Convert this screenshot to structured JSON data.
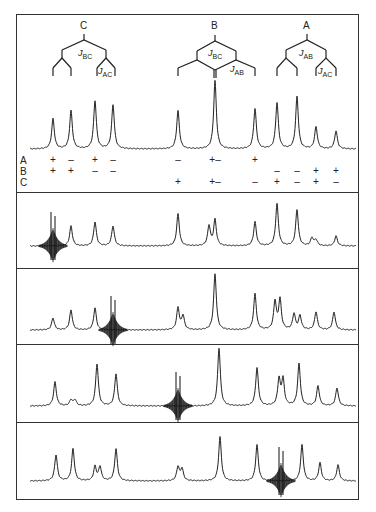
{
  "figure": {
    "trees": [
      {
        "nucleus": "C",
        "x": 84,
        "couplings": [
          {
            "name": "J",
            "sub": "BC"
          },
          {
            "name": "J",
            "sub": "AC"
          }
        ]
      },
      {
        "nucleus": "B",
        "x": 215,
        "couplings": [
          {
            "name": "J",
            "sub": "BC"
          },
          {
            "name": "J",
            "sub": "AB"
          }
        ]
      },
      {
        "nucleus": "A",
        "x": 307,
        "couplings": [
          {
            "name": "J",
            "sub": "AB"
          },
          {
            "name": "J",
            "sub": "AC"
          }
        ]
      }
    ],
    "labels": {
      "tree_C": "C",
      "tree_B": "B",
      "tree_A": "A",
      "j_C_1": "J",
      "j_C_1_sub": "BC",
      "j_C_2": "J",
      "j_C_2_sub": "AC",
      "j_B_1": "J",
      "j_B_1_sub": "BC",
      "j_B_2": "J",
      "j_B_2_sub": "AB",
      "j_A_1": "J",
      "j_A_1_sub": "AB",
      "j_A_2": "J",
      "j_A_2_sub": "AC"
    },
    "sign_rows": {
      "labels": [
        "A",
        "B",
        "C"
      ],
      "A": [
        {
          "x": 53,
          "s": "+"
        },
        {
          "x": 71,
          "s": "–"
        },
        {
          "x": 95,
          "s": "+"
        },
        {
          "x": 113,
          "s": "–"
        },
        {
          "x": 178,
          "s": "–"
        },
        {
          "x": 215,
          "s": "+–"
        },
        {
          "x": 255,
          "s": "+"
        }
      ],
      "B": [
        {
          "x": 53,
          "s": "+"
        },
        {
          "x": 71,
          "s": "+"
        },
        {
          "x": 95,
          "s": "–"
        },
        {
          "x": 113,
          "s": "–"
        },
        {
          "x": 277,
          "s": "–"
        },
        {
          "x": 297,
          "s": "–"
        },
        {
          "x": 316,
          "s": "+"
        },
        {
          "x": 336,
          "s": "+"
        }
      ],
      "C": [
        {
          "x": 178,
          "s": "+"
        },
        {
          "x": 215,
          "s": "+–"
        },
        {
          "x": 255,
          "s": "–"
        },
        {
          "x": 277,
          "s": "+"
        },
        {
          "x": 297,
          "s": "–"
        },
        {
          "x": 316,
          "s": "+"
        },
        {
          "x": 336,
          "s": "–"
        }
      ]
    },
    "spectra": [
      {
        "name": "reference",
        "top": 14,
        "baseline": 149,
        "peaks": [
          [
            53,
            30
          ],
          [
            71,
            38
          ],
          [
            95,
            48
          ],
          [
            113,
            44
          ],
          [
            178,
            38
          ],
          [
            215,
            68
          ],
          [
            255,
            40
          ],
          [
            277,
            46
          ],
          [
            297,
            52
          ],
          [
            316,
            22
          ],
          [
            336,
            18
          ]
        ],
        "irradiated": null
      },
      {
        "name": "irradiate-C-line",
        "top": 192,
        "baseline": 246,
        "peaks": [
          [
            71,
            20
          ],
          [
            95,
            24
          ],
          [
            113,
            20
          ],
          [
            178,
            32
          ],
          [
            209,
            20
          ],
          [
            215,
            26
          ],
          [
            255,
            24
          ],
          [
            277,
            42
          ],
          [
            297,
            36
          ],
          [
            312,
            8
          ],
          [
            316,
            6
          ],
          [
            336,
            10
          ]
        ],
        "irradiated": 53
      },
      {
        "name": "irradiate-C-line-2",
        "top": 268,
        "baseline": 330,
        "peaks": [
          [
            53,
            12
          ],
          [
            71,
            20
          ],
          [
            95,
            22
          ],
          [
            178,
            22
          ],
          [
            183,
            14
          ],
          [
            215,
            56
          ],
          [
            255,
            36
          ],
          [
            275,
            28
          ],
          [
            280,
            30
          ],
          [
            294,
            16
          ],
          [
            300,
            14
          ],
          [
            316,
            18
          ],
          [
            334,
            18
          ]
        ],
        "irradiated": 113
      },
      {
        "name": "irradiate-B-line",
        "top": 344,
        "baseline": 406,
        "peaks": [
          [
            55,
            24
          ],
          [
            71,
            6
          ],
          [
            75,
            6
          ],
          [
            97,
            42
          ],
          [
            116,
            32
          ],
          [
            219,
            58
          ],
          [
            257,
            38
          ],
          [
            279,
            26
          ],
          [
            283,
            26
          ],
          [
            299,
            42
          ],
          [
            318,
            20
          ],
          [
            337,
            18
          ]
        ],
        "irradiated": 178
      },
      {
        "name": "irradiate-A-line",
        "top": 422,
        "baseline": 481,
        "peaks": [
          [
            56,
            26
          ],
          [
            73,
            32
          ],
          [
            95,
            14
          ],
          [
            100,
            14
          ],
          [
            116,
            32
          ],
          [
            178,
            14
          ],
          [
            182,
            12
          ],
          [
            220,
            44
          ],
          [
            257,
            36
          ],
          [
            302,
            36
          ],
          [
            320,
            18
          ],
          [
            338,
            16
          ]
        ],
        "irradiated": 281
      }
    ],
    "caption_fragment": ". . .  .  . . . . ."
  }
}
